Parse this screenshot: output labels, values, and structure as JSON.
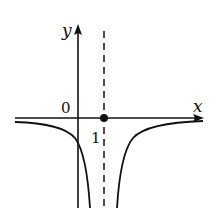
{
  "diagram": {
    "type": "function-graph",
    "axes": {
      "x_label": "x",
      "y_label": "y",
      "origin_label": "0",
      "tick_label": "1"
    },
    "asymptote": {
      "style": "dashed",
      "x_value": 1
    },
    "marked_point": {
      "x": 1,
      "y": 0
    },
    "colors": {
      "ink": "#111111",
      "background": "#ffffff"
    }
  }
}
